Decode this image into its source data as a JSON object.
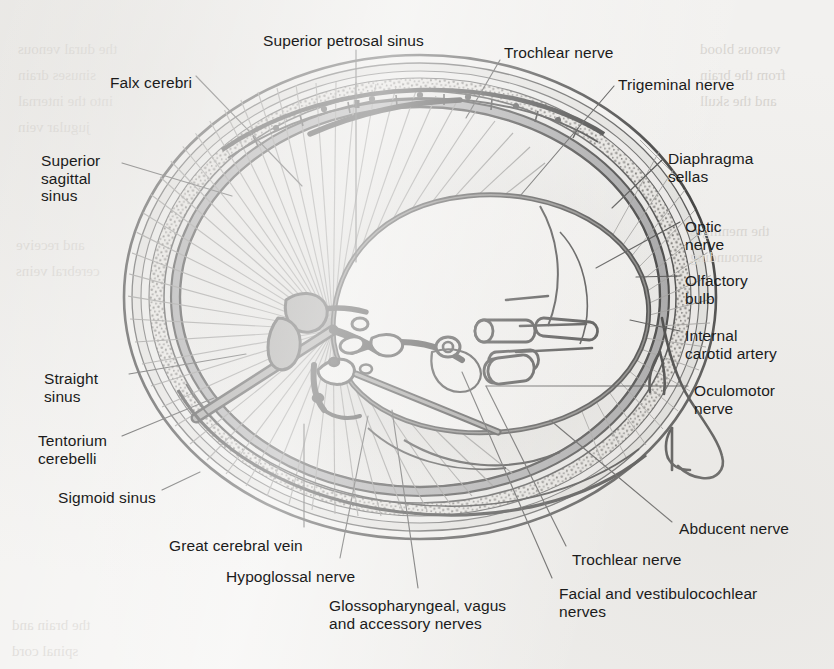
{
  "figure": {
    "view": "superior view of cranial cavity with lateral head profile",
    "background_color": "#f2f1ef",
    "ink_color": "#1b1b1b",
    "label_font_size_px": 15.5
  },
  "labels": {
    "falx_cerebri": "Falx cerebri",
    "superior_petrosal_sinus": "Superior petrosal sinus",
    "trochlear_nerve_top": "Trochlear nerve",
    "trigeminal_nerve": "Trigeminal nerve",
    "superior_sagittal_sinus": "Superior\nsagittal\nsinus",
    "diaphragma_sellas": "Diaphragma\nsellas",
    "optic_nerve": "Optic\nnerve",
    "olfactory_bulb": "Olfactory\nbulb",
    "internal_carotid_artery": "Internal\ncarotid artery",
    "oculomotor_nerve": "Oculomotor\nnerve",
    "straight_sinus": "Straight\nsinus",
    "tentorium_cerebelli": "Tentorium\ncerebelli",
    "sigmoid_sinus": "Sigmoid sinus",
    "great_cerebral_vein": "Great cerebral vein",
    "hypoglossal_nerve": "Hypoglossal nerve",
    "glossopharyngeal_vagus_accessory": "Glossopharyngeal, vagus\nand accessory nerves",
    "facial_vestibulocochlear": "Facial and vestibulocochlear\nnerves",
    "trochlear_nerve_bottom": "Trochlear nerve",
    "abducent_nerve": "Abducent nerve"
  },
  "label_list": [
    {
      "key": "falx_cerebri",
      "text": "Falx cerebri",
      "x": 110,
      "y": 74,
      "align": "left"
    },
    {
      "key": "superior_petrosal_sinus",
      "text": "Superior petrosal sinus",
      "x": 263,
      "y": 32,
      "align": "left"
    },
    {
      "key": "trochlear_nerve_top",
      "text": "Trochlear nerve",
      "x": 504,
      "y": 44,
      "align": "left"
    },
    {
      "key": "trigeminal_nerve",
      "text": "Trigeminal nerve",
      "x": 618,
      "y": 76,
      "align": "left"
    },
    {
      "key": "superior_sagittal_sinus",
      "text": "Superior sagittal sinus",
      "x": 41,
      "y": 152,
      "align": "left"
    },
    {
      "key": "diaphragma_sellas",
      "text": "Diaphragma sellas",
      "x": 668,
      "y": 150,
      "align": "left"
    },
    {
      "key": "optic_nerve",
      "text": "Optic nerve",
      "x": 685,
      "y": 218,
      "align": "left"
    },
    {
      "key": "olfactory_bulb",
      "text": "Olfactory bulb",
      "x": 685,
      "y": 272,
      "align": "left"
    },
    {
      "key": "internal_carotid_artery",
      "text": "Internal carotid artery",
      "x": 685,
      "y": 327,
      "align": "left"
    },
    {
      "key": "oculomotor_nerve",
      "text": "Oculomotor nerve",
      "x": 694,
      "y": 382,
      "align": "left"
    },
    {
      "key": "straight_sinus",
      "text": "Straight sinus",
      "x": 44,
      "y": 370,
      "align": "left"
    },
    {
      "key": "tentorium_cerebelli",
      "text": "Tentorium cerebelli",
      "x": 38,
      "y": 432,
      "align": "left"
    },
    {
      "key": "sigmoid_sinus",
      "text": "Sigmoid sinus",
      "x": 58,
      "y": 489,
      "align": "left"
    },
    {
      "key": "great_cerebral_vein",
      "text": "Great cerebral vein",
      "x": 169,
      "y": 537,
      "align": "left"
    },
    {
      "key": "hypoglossal_nerve",
      "text": "Hypoglossal nerve",
      "x": 226,
      "y": 568,
      "align": "left"
    },
    {
      "key": "glossopharyngeal_vagus_accessory",
      "text": "Glossopharyngeal, vagus and accessory nerves",
      "x": 329,
      "y": 597,
      "align": "left"
    },
    {
      "key": "facial_vestibulocochlear",
      "text": "Facial and vestibulocochlear nerves",
      "x": 559,
      "y": 585,
      "align": "left"
    },
    {
      "key": "trochlear_nerve_bottom",
      "text": "Trochlear nerve",
      "x": 572,
      "y": 551,
      "align": "left"
    },
    {
      "key": "abducent_nerve",
      "text": "Abducent nerve",
      "x": 679,
      "y": 520,
      "align": "left"
    }
  ],
  "structures": [
    "skull vault cross-section (outer table, diploe, inner table)",
    "dura mater",
    "superior sagittal sinus",
    "falx cerebri attachment",
    "tentorium cerebelli with radiating fibres",
    "straight sinus",
    "transverse sinus",
    "sigmoid sinus",
    "superior petrosal sinus",
    "diaphragma sellae",
    "cranial nerve foramina of the skull base",
    "lateral face and nose profile"
  ],
  "colors": {
    "background": "#f2f1ef",
    "ink": "#1b1b1b",
    "dura_dark": "#57565a",
    "dura_mid": "#8d8c90",
    "bone_light": "#d5d4d1",
    "diploe": "#bfbdb8",
    "tentorium_fill": "#e7e6e3",
    "leader_line": "#3a3a3a"
  },
  "ghost_text": [
    {
      "text": "the dural venous",
      "x": 18,
      "y": 36
    },
    {
      "text": "sinuses drain",
      "x": 18,
      "y": 62
    },
    {
      "text": "into the internal",
      "x": 18,
      "y": 88
    },
    {
      "text": "jugular vein",
      "x": 18,
      "y": 114
    },
    {
      "text": "and receive",
      "x": 16,
      "y": 232
    },
    {
      "text": "cerebral veins",
      "x": 16,
      "y": 258
    },
    {
      "text": "venous blood",
      "x": 700,
      "y": 36
    },
    {
      "text": "from the brain",
      "x": 700,
      "y": 62
    },
    {
      "text": "and the skull",
      "x": 700,
      "y": 88
    },
    {
      "text": "the meninges",
      "x": 690,
      "y": 218
    },
    {
      "text": "surrounding",
      "x": 690,
      "y": 244
    },
    {
      "text": "the brain and",
      "x": 12,
      "y": 612
    },
    {
      "text": "spinal cord",
      "x": 12,
      "y": 638
    }
  ]
}
